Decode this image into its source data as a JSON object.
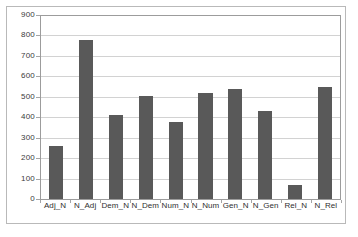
{
  "chart_data": {
    "type": "bar",
    "title": "",
    "subtitle": "",
    "xlabel": "",
    "ylabel": "",
    "categories": [
      "Adj_N",
      "N_Adj",
      "Dem_N",
      "N_Dem",
      "Num_N",
      "N_Num",
      "Gen_N",
      "N_Gen",
      "Rel_N",
      "N_Rel"
    ],
    "values": [
      258,
      780,
      410,
      502,
      375,
      520,
      540,
      430,
      68,
      550
    ],
    "series": [
      {
        "name": "",
        "values": [
          258,
          780,
          410,
          502,
          375,
          520,
          540,
          430,
          68,
          550
        ]
      }
    ],
    "ylim": [
      0,
      900
    ],
    "ytick_step": 100,
    "yticks": [
      900,
      800,
      700,
      600,
      500,
      400,
      300,
      200,
      100,
      0
    ],
    "ytick_labels": [
      "900",
      "800",
      "700",
      "600",
      "500",
      "400",
      "300",
      "200",
      "100",
      "0"
    ],
    "grid": true,
    "grid_axis": "y",
    "legend": false,
    "legend_position": "none",
    "bar_color": "#595959",
    "gridline_color": "#d2d2d2",
    "axis_color": "#9c9c9c",
    "plot_background": "#ffffff",
    "frame_color": "#b9b9b9"
  }
}
